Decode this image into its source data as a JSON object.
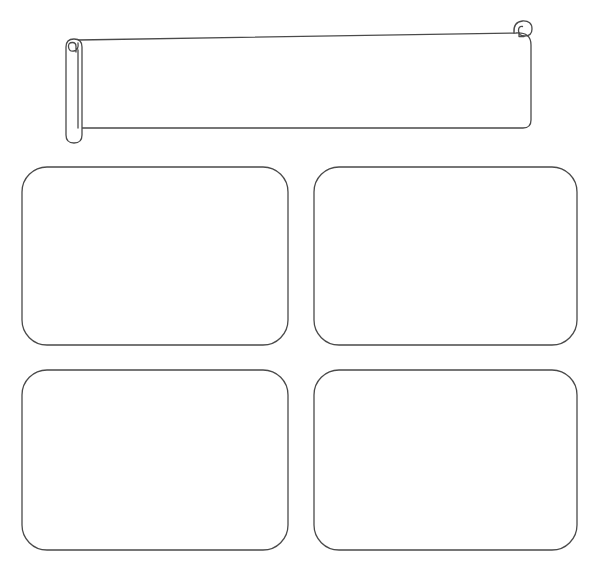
{
  "canvas": {
    "width": 597,
    "height": 585,
    "background_color": "#ffffff",
    "stroke_color": "#4a4a4a",
    "stroke_color_light": "#6b6b6b",
    "stroke_width": 1.3,
    "style": "hand-drawn-wireframe-sketch"
  },
  "banner": {
    "name": "scroll-banner",
    "label": "",
    "fill_color": "#ffffff",
    "stroke_color": "#4a4a4a",
    "body": {
      "left": 76,
      "top": 38,
      "right": 531,
      "bottom": 128,
      "corner_radius": 8
    },
    "left_roll": {
      "name": "scroll-roll-left",
      "center_x": 74,
      "top": 42,
      "bottom": 143,
      "width": 17,
      "curl_center_x": 74,
      "curl_center_y": 46,
      "curl_radius": 8
    },
    "right_roll": {
      "name": "scroll-roll-right",
      "curl_center_x": 523,
      "curl_center_y": 26,
      "curl_radius": 9
    }
  },
  "cards": {
    "columns": 2,
    "rows": 2,
    "corner_radius": 25,
    "fill_color": "#ffffff",
    "stroke_color": "#4a4a4a",
    "items": [
      {
        "name": "card-placeholder-1",
        "label": "",
        "position": "top-left",
        "x": 22,
        "y": 167,
        "width": 266,
        "height": 178
      },
      {
        "name": "card-placeholder-2",
        "label": "",
        "position": "top-right",
        "x": 314,
        "y": 167,
        "width": 263,
        "height": 178
      },
      {
        "name": "card-placeholder-3",
        "label": "",
        "position": "bottom-left",
        "x": 22,
        "y": 370,
        "width": 266,
        "height": 180
      },
      {
        "name": "card-placeholder-4",
        "label": "",
        "position": "bottom-right",
        "x": 314,
        "y": 370,
        "width": 263,
        "height": 180
      }
    ]
  }
}
